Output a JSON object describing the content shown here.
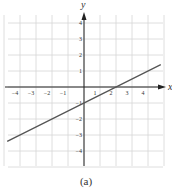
{
  "caption": "(a)",
  "chart_data": {
    "type": "line",
    "title": "",
    "xlabel": "x",
    "ylabel": "y",
    "xlim": [
      -5,
      5
    ],
    "ylim": [
      -5,
      5
    ],
    "grid": true,
    "x_ticks": [
      -4,
      -3,
      -2,
      -1,
      1,
      2,
      3,
      4
    ],
    "y_ticks": [
      4,
      3,
      2,
      1,
      -1,
      -2,
      -3,
      -4
    ],
    "series": [
      {
        "name": "y = 0.5x - 1",
        "slope": 0.5,
        "intercept": -1,
        "x": [
          -4.8,
          4.8
        ],
        "y": [
          -3.4,
          1.4
        ],
        "color": "#555555"
      }
    ],
    "annotations": []
  },
  "colors": {
    "grid": "#d6d6d6",
    "axis": "#222222",
    "line": "#555555",
    "text": "#333333"
  }
}
